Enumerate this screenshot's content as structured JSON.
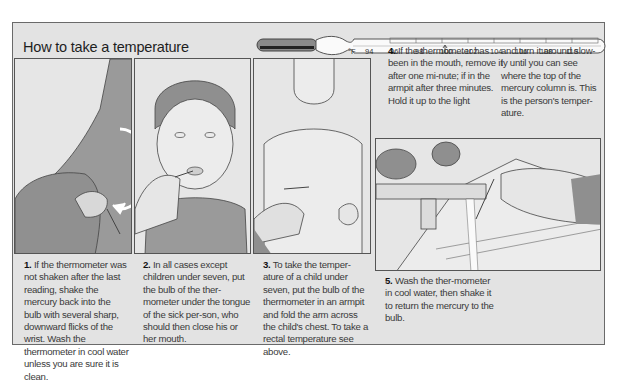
{
  "title": "How to take a temperature",
  "thermometer": {
    "unit_label": "°F",
    "scale_labels": [
      "94",
      "96",
      "98",
      "100",
      "102",
      "104",
      "106",
      "108",
      "110"
    ],
    "normal_marker": "98.6 arrow",
    "icon": "thermometer-icon"
  },
  "steps": [
    {
      "number": "1.",
      "text": "If the thermometer was not shaken after the last reading, shake the mercury back into the bulb with several sharp, downward flicks of the wrist. Wash the thermometer in cool water unless you are sure it is clean.",
      "illustration": "shaking-thermometer-illustration"
    },
    {
      "number": "2.",
      "text": "In all cases except children under seven, put the bulb of the ther-mometer under the tongue of the sick per-son, who should then close his or her mouth.",
      "illustration": "oral-thermometer-illustration"
    },
    {
      "number": "3.",
      "text": "To take the temper-ature of a child under seven, put the bulb of the thermometer in an armpit and fold the arm across the child's chest. To take a rectal temperature see above.",
      "illustration": "armpit-thermometer-illustration"
    },
    {
      "number": "4.",
      "text": "If the thermometer has been in the mouth, remove it after one mi-nute; if in the armpit after three minutes. Hold it up to the light and turn it around slow-ly until you can see where the top of the mercury column is. This is the person's temper-ature.",
      "text_col1": "If the thermometer has been in the mouth, remove it after one mi-nute; if in the armpit after three minutes. Hold it up to the light",
      "text_col2": "and turn it around slow-ly until you can see where the top of the mercury column is. This is the person's temper-ature."
    },
    {
      "number": "5.",
      "text": "Wash the ther-mometer in cool water, then shake it to return the mercury to the bulb.",
      "illustration": "washing-thermometer-illustration"
    }
  ]
}
